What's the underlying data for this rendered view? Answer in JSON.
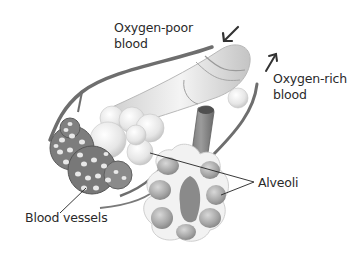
{
  "diagram": {
    "labels": {
      "oxygen_poor_line1": "Oxygen-poor",
      "oxygen_poor_line2": "blood",
      "oxygen_rich_line1": "Oxygen-rich",
      "oxygen_rich_line2": "blood",
      "alveoli": "Alveoli",
      "blood_vessels": "Blood vessels"
    },
    "arrows": [
      {
        "name": "oxygen-poor-arrow",
        "direction": "down-left"
      },
      {
        "name": "oxygen-rich-arrow",
        "direction": "up-right"
      }
    ],
    "colors": {
      "background": "#ffffff",
      "text": "#2a2a2a",
      "vessel": "#6e6e6e",
      "alveolus_light": "#efefef",
      "alveolus_dark": "#9a9a9a",
      "leader_line": "#222222"
    }
  }
}
